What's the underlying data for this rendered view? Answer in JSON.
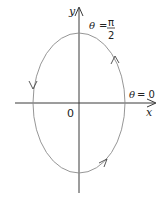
{
  "diagram": {
    "type": "parametric-ellipse",
    "colors": {
      "axis": "#3a3a3a",
      "curve": "#8a8a8a",
      "text": "#222222",
      "background": "#ffffff"
    },
    "axes": {
      "x_label": "x",
      "y_label": "y",
      "origin_label": "0"
    },
    "annotations": {
      "theta_symbol": "θ",
      "theta_pi_over_2_eq": "=",
      "theta_pi_num": "π",
      "theta_pi_den": "2",
      "theta_zero_eq": "= 0"
    },
    "curve": {
      "shape": "ellipse",
      "direction": "counterclockwise",
      "arrows": [
        "right-side-up",
        "left-side-down",
        "bottom-right-up"
      ]
    }
  }
}
